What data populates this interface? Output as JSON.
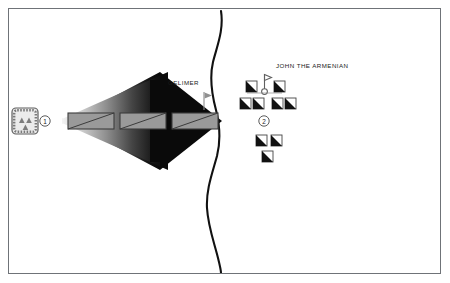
{
  "diagram": {
    "title_visible": false,
    "background_color": "#ffffff",
    "frame_color": "#6f7378",
    "labels": {
      "gelimer": "GELIMER",
      "john_the_armenian": "JOHN THE ARMENIAN"
    },
    "markers": [
      {
        "id": "marker-1",
        "text": "1",
        "x": 45,
        "y": 121
      },
      {
        "id": "marker-2",
        "text": "2",
        "x": 264,
        "y": 121
      }
    ],
    "river": {
      "name": "river-line",
      "color": "#111111",
      "stroke_width": 2.1,
      "path": "M 221 11 C 224 30, 217 46, 213 62 C 209 79, 212 95, 216 110 C 220 126, 221 140, 217 156 C 212 174, 206 190, 207 208 C 208 226, 214 242, 218 258 C 220 266, 221 270, 221 273"
    },
    "arrow": {
      "name": "vandal-advance-arrow",
      "gradient_from": "#f2f2f2",
      "gradient_to": "#0a0a0a",
      "head_color": "#0a0a0a",
      "direction": "east"
    },
    "infantry_blocks": [
      {
        "x": 68,
        "y": 113,
        "w": 46,
        "h": 16
      },
      {
        "x": 120,
        "y": 113,
        "w": 46,
        "h": 16
      },
      {
        "x": 172,
        "y": 113,
        "w": 46,
        "h": 16
      }
    ],
    "infantry_block_style": {
      "fill": "#9a9a9a",
      "stroke": "#3c3c3c",
      "diagonal": "true"
    },
    "fortified_camp": {
      "name": "fortified-camp-symbol",
      "x": 12,
      "y": 108,
      "w": 26,
      "h": 26,
      "fill": "#e6e6e6",
      "border": "#5e5e5e",
      "triangle_count": 3,
      "triangle_color": "#6a6a6a"
    },
    "gelimer_standard": {
      "name": "gelimer-flag",
      "x": 203,
      "y": 93,
      "color": "#8c8c8c"
    },
    "byzantine_standard": {
      "name": "byzantine-standard",
      "x": 263,
      "y": 74,
      "color": "#6e6e6e"
    },
    "byzantine_units": [
      {
        "x": 246,
        "y": 81
      },
      {
        "x": 274,
        "y": 81
      },
      {
        "x": 240,
        "y": 98
      },
      {
        "x": 253,
        "y": 98
      },
      {
        "x": 272,
        "y": 98
      },
      {
        "x": 285,
        "y": 98
      },
      {
        "x": 256,
        "y": 135
      },
      {
        "x": 271,
        "y": 135
      },
      {
        "x": 262,
        "y": 151
      }
    ],
    "byzantine_unit_style": {
      "fill": "#ffffff",
      "stroke": "#444444",
      "wedge_color": "#111111",
      "size": 11
    }
  }
}
